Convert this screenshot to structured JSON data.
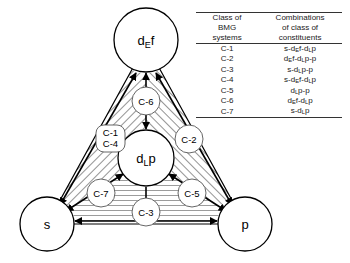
{
  "diagram": {
    "nodes": [
      {
        "id": "def",
        "label_main": "d",
        "label_sub": "E",
        "label_tail": "f",
        "name": "node-def"
      },
      {
        "id": "dlp",
        "label_main": "d",
        "label_sub": "L",
        "label_tail": "p",
        "name": "node-dlp"
      },
      {
        "id": "s",
        "label_main": "s",
        "label_sub": "",
        "label_tail": "",
        "name": "node-s"
      },
      {
        "id": "p",
        "label_main": "p",
        "label_sub": "",
        "label_tail": "",
        "name": "node-p"
      }
    ],
    "edge_labels": [
      {
        "id": "c1",
        "text": "C-1"
      },
      {
        "id": "c2",
        "text": "C-2"
      },
      {
        "id": "c3",
        "text": "C-3"
      },
      {
        "id": "c4",
        "text": "C-4"
      },
      {
        "id": "c5",
        "text": "C-5"
      },
      {
        "id": "c6",
        "text": "C-6"
      },
      {
        "id": "c7",
        "text": "C-7"
      }
    ],
    "colors": {
      "stroke": "#000000",
      "hatch": "#3a3a3a",
      "node_fill": "#ffffff",
      "background": "#ffffff"
    }
  },
  "table": {
    "headers": {
      "col1_line1": "Class of",
      "col1_line2": "BMG",
      "col1_line3": "systems",
      "col2_line1": "Combinations",
      "col2_line2": "of class of",
      "col2_line3": "constituents"
    },
    "rows": [
      {
        "class": "C-1",
        "combination": "s-d<sub>E</sub>f-d<sub>L</sub>p"
      },
      {
        "class": "C-2",
        "combination": "d<sub>E</sub>f-d<sub>L</sub>p-p"
      },
      {
        "class": "C-3",
        "combination": "s-d<sub>L</sub>p-p"
      },
      {
        "class": "C-4",
        "combination": "s-d<sub>E</sub>f-d<sub>L</sub>p"
      },
      {
        "class": "C-5",
        "combination": "d<sub>L</sub>p-p"
      },
      {
        "class": "C-6",
        "combination": "d<sub>E</sub>f-d<sub>L</sub>p"
      },
      {
        "class": "C-7",
        "combination": "s-d<sub>L</sub>p"
      }
    ]
  }
}
